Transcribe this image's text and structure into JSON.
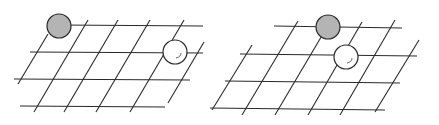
{
  "figure": {
    "colors": {
      "line": "#2a2a2a",
      "black_stone": "#b4b4b4",
      "white_stone": "#ffffff",
      "background": "#ffffff"
    },
    "panels": [
      {
        "id": "left",
        "horizontal_lines": [
          {
            "x1": 60,
            "y1": 25,
            "x2": 203,
            "y2": 26
          },
          {
            "x1": 30,
            "y1": 52,
            "x2": 203,
            "y2": 53
          },
          {
            "x1": 14,
            "y1": 79,
            "x2": 190,
            "y2": 80
          },
          {
            "x1": 20,
            "y1": 106,
            "x2": 165,
            "y2": 107
          }
        ],
        "diagonal_lines": [
          {
            "x1": 18,
            "y1": 84,
            "x2": 48,
            "y2": 34
          },
          {
            "x1": 34,
            "y1": 112,
            "x2": 88,
            "y2": 20
          },
          {
            "x1": 64,
            "y1": 112,
            "x2": 118,
            "y2": 20
          },
          {
            "x1": 96,
            "y1": 112,
            "x2": 150,
            "y2": 20
          },
          {
            "x1": 130,
            "y1": 112,
            "x2": 184,
            "y2": 20
          },
          {
            "x1": 168,
            "y1": 103,
            "x2": 204,
            "y2": 42
          }
        ],
        "stones": [
          {
            "color": "black",
            "cx": 59,
            "cy": 26,
            "r": 12
          },
          {
            "color": "white",
            "cx": 175,
            "cy": 52,
            "r": 12
          }
        ]
      },
      {
        "id": "right",
        "horizontal_lines": [
          {
            "x1": 274,
            "y1": 26,
            "x2": 402,
            "y2": 28
          },
          {
            "x1": 240,
            "y1": 54,
            "x2": 417,
            "y2": 56
          },
          {
            "x1": 225,
            "y1": 81,
            "x2": 400,
            "y2": 83
          },
          {
            "x1": 210,
            "y1": 108,
            "x2": 385,
            "y2": 110
          }
        ],
        "diagonal_lines": [
          {
            "x1": 212,
            "y1": 110,
            "x2": 252,
            "y2": 45
          },
          {
            "x1": 242,
            "y1": 115,
            "x2": 298,
            "y2": 21
          },
          {
            "x1": 275,
            "y1": 115,
            "x2": 330,
            "y2": 22
          },
          {
            "x1": 308,
            "y1": 115,
            "x2": 362,
            "y2": 22
          },
          {
            "x1": 340,
            "y1": 115,
            "x2": 395,
            "y2": 20
          },
          {
            "x1": 375,
            "y1": 112,
            "x2": 419,
            "y2": 40
          }
        ],
        "stones": [
          {
            "color": "black",
            "cx": 328,
            "cy": 27,
            "r": 12
          },
          {
            "color": "white",
            "cx": 346,
            "cy": 57,
            "r": 12
          }
        ]
      }
    ]
  }
}
